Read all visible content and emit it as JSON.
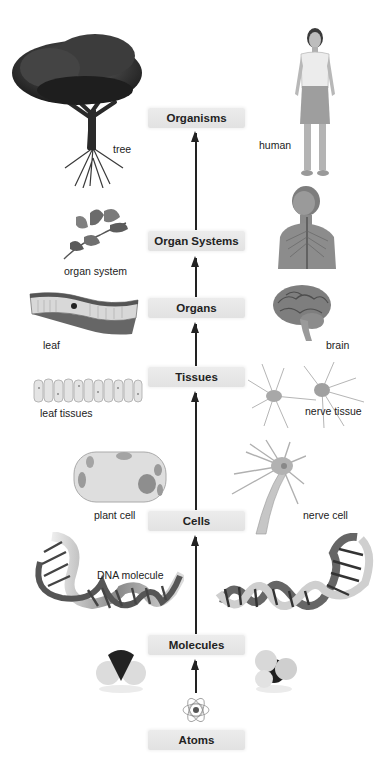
{
  "diagram": {
    "type": "hierarchy",
    "direction": "bottom-to-top",
    "levels": [
      {
        "label": "Organisms"
      },
      {
        "label": "Organ Systems"
      },
      {
        "label": "Organs"
      },
      {
        "label": "Tissues"
      },
      {
        "label": "Cells"
      },
      {
        "label": "Molecules"
      },
      {
        "label": "Atoms"
      }
    ],
    "captions": {
      "tree": "tree",
      "human": "human",
      "organ_system": "organ system",
      "leaf": "leaf",
      "brain": "brain",
      "leaf_tissues": "leaf tissues",
      "nerve_tissue": "nerve tissue",
      "plant_cell": "plant cell",
      "nerve_cell": "nerve cell",
      "dna_molecule": "DNA molecule"
    },
    "images": {
      "organisms_left": "tree-illustration",
      "organisms_right": "human-figure-illustration",
      "organ_systems_left": "leaf-branch-illustration",
      "organ_systems_right": "nervous-system-torso-illustration",
      "organs_left": "leaf-cross-section-illustration",
      "organs_right": "brain-illustration",
      "tissues_left": "leaf-tissue-illustration",
      "tissues_right": "nerve-tissue-illustration",
      "cells_left": "plant-cell-illustration",
      "cells_right": "nerve-cell-illustration",
      "molecules": "dna-double-helix-illustration",
      "molecules_left": "water-molecule-model",
      "molecules_right": "methane-molecule-model",
      "atoms": "atom-orbital-icon"
    }
  }
}
